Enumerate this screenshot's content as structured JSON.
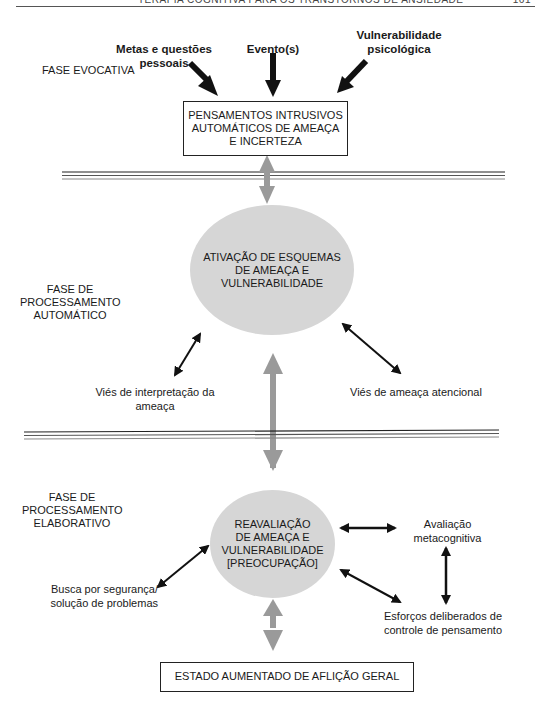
{
  "header": {
    "running_title": "TERAPIA COGNITIVA PARA OS TRANSTORNOS DE ANSIEDADE",
    "page_number": "161"
  },
  "phases": {
    "evocative": "FASE EVOCATIVA",
    "automatic": [
      "FASE DE",
      "PROCESSAMENTO",
      "AUTOMÁTICO"
    ],
    "elaborative": [
      "FASE DE",
      "PROCESSAMENTO",
      "ELABORATIVO"
    ]
  },
  "inputs": {
    "goals": [
      "Metas e questões",
      "pessoais"
    ],
    "events": "Evento(s)",
    "vulnerability": [
      "Vulnerabilidade",
      "psicológica"
    ]
  },
  "nodes": {
    "intrusive_thoughts": [
      "PENSAMENTOS INTRUSIVOS",
      "AUTOMÁTICOS DE AMEAÇA",
      "E INCERTEZA"
    ],
    "schema_activation": [
      "ATIVAÇÃO DE ESQUEMAS",
      "DE AMEAÇA E",
      "VULNERABILIDADE"
    ],
    "reappraisal": [
      "REAVALIAÇÃO",
      "DE AMEAÇA E",
      "VULNERABILIDADE",
      "[PREOCUPAÇÃO]"
    ],
    "distress": "ESTADO AUMENTADO DE AFLIÇÃO GERAL"
  },
  "labels": {
    "interpretation_bias": [
      "Viés de interpretação da",
      "ameaça"
    ],
    "attentional_bias": "Viés de ameaça atencional",
    "safety_seeking": [
      "Busca por segurança/",
      "solução de problemas"
    ],
    "metacognitive": [
      "Avaliação",
      "metacognitiva"
    ],
    "thought_control": [
      "Esforços deliberados de",
      "controle de pensamento"
    ]
  },
  "colors": {
    "ellipse_fill": "#d6d6d6",
    "gray_arrow": "#9a9a9a",
    "black_arrow": "#111111"
  }
}
